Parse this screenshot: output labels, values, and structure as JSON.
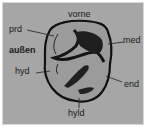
{
  "diagram": {
    "labels": {
      "front": "vorne",
      "outer": "außen",
      "protoconid": "prd",
      "metaconid": "med",
      "hypoconid": "hyd",
      "entoconid": "end",
      "hypoconulid": "hyld"
    },
    "colors": {
      "background": "#a6a6a6",
      "tooth_outline": "#111111",
      "tooth_fill": "#9a9a9a",
      "text": "#1a1a1a"
    }
  }
}
